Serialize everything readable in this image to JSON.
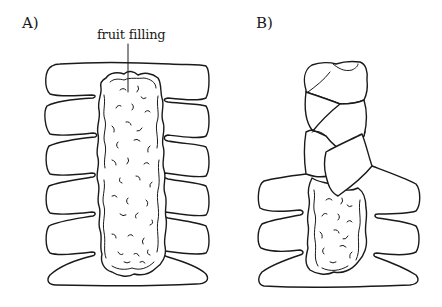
{
  "figure": {
    "panels": [
      {
        "id": "A",
        "label": "A)",
        "description": "Dough rectangle with side strips cut, fruit filling down the center",
        "callouts": [
          {
            "text": "fruit filling"
          }
        ]
      },
      {
        "id": "B",
        "label": "B)",
        "description": "Side strips folded over the filling in a braided pattern, partially complete"
      }
    ],
    "colors": {
      "stroke": "#1a1a1a",
      "background": "#ffffff"
    }
  }
}
